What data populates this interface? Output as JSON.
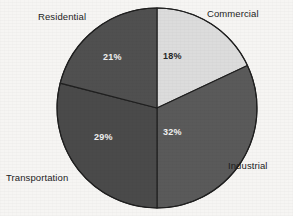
{
  "figure": {
    "background_color": "#f6f5f3",
    "width": 293,
    "height": 216
  },
  "chart_data": {
    "type": "pie",
    "title": "",
    "subtitle": "",
    "xlabel": "",
    "ylabel": "",
    "legend_position": "none",
    "grid": false,
    "start_angle_deg": 0,
    "direction": "clockwise",
    "center": {
      "x": 157,
      "y": 108
    },
    "radius": 100,
    "unit": "%",
    "categories": [
      "Commercial",
      "Industrial",
      "Transportation",
      "Residential"
    ],
    "values": [
      18,
      32,
      29,
      21
    ],
    "value_labels": [
      "18%",
      "32%",
      "29%",
      "21%"
    ],
    "slice_colors": [
      "#dcdcdc",
      "#5a5a5a",
      "#4a4a4a",
      "#505050"
    ],
    "slices": [
      {
        "name": "Commercial",
        "value": 18,
        "value_label": "18%",
        "color": "#dcdcdc",
        "label": "Commercial",
        "label_color": "#1c1c1c",
        "value_label_color": "#262626",
        "start_deg": 0,
        "end_deg": 64.8
      },
      {
        "name": "Industrial",
        "value": 32,
        "value_label": "32%",
        "color": "#5a5a5a",
        "label": "Industrial",
        "label_color": "#1c1c1c",
        "value_label_color": "#f2f2f2",
        "start_deg": 64.8,
        "end_deg": 180.0
      },
      {
        "name": "Transportation",
        "value": 29,
        "value_label": "29%",
        "color": "#4a4a4a",
        "label": "Transportation",
        "label_color": "#1c1c1c",
        "value_label_color": "#f2f2f2",
        "start_deg": 180.0,
        "end_deg": 284.4
      },
      {
        "name": "Residential",
        "value": 21,
        "value_label": "21%",
        "color": "#505050",
        "label": "Residential",
        "label_color": "#1c1c1c",
        "value_label_color": "#f2f2f2",
        "start_deg": 284.4,
        "end_deg": 360.0
      }
    ]
  }
}
